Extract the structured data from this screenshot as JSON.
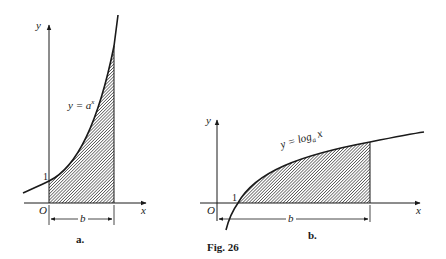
{
  "figure": {
    "caption": "Fig. 26",
    "panels": [
      {
        "id": "a",
        "label": "a.",
        "axis_x": "x",
        "axis_y": "y",
        "origin": "O",
        "y_intercept_label": "1",
        "curve_label": "y = a",
        "curve_label_sup": "x",
        "width_label": "b"
      },
      {
        "id": "b",
        "label": "b.",
        "axis_x": "x",
        "axis_y": "y",
        "origin": "O",
        "x_intercept_label": "1",
        "curve_label": "y = log",
        "curve_label_sub": "a",
        "curve_label_tail": " x",
        "width_label": "b"
      }
    ]
  },
  "colors": {
    "ink": "#1a1a1a",
    "background": "#ffffff"
  }
}
